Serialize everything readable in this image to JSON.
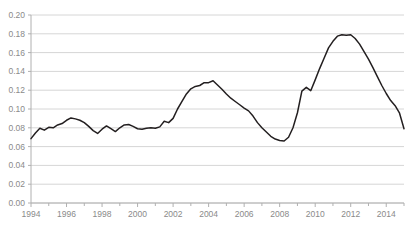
{
  "chart_data": {
    "type": "line",
    "title": "",
    "subtitle": "",
    "xlabel": "",
    "ylabel": "",
    "grid": true,
    "legend": false,
    "legend_position": "none",
    "line_color": "#231f20",
    "grid_color": "#d6d6d6",
    "axis_color": "#b0b0b0",
    "tick_label_color": "#8a8a8a",
    "xlim": [
      1994,
      2015.0
    ],
    "ylim": [
      0.0,
      0.2
    ],
    "y_ticks": [
      "0.00",
      "0.02",
      "0.04",
      "0.06",
      "0.08",
      "0.10",
      "0.12",
      "0.14",
      "0.16",
      "0.18",
      "0.20"
    ],
    "y_tick_values": [
      0.0,
      0.02,
      0.04,
      0.06,
      0.08,
      0.1,
      0.12,
      0.14,
      0.16,
      0.18,
      0.2
    ],
    "x_ticks": [
      "1994",
      "1996",
      "1998",
      "2000",
      "2002",
      "2004",
      "2006",
      "2008",
      "2010",
      "2012",
      "2014"
    ],
    "x_tick_values": [
      1994,
      1996,
      1998,
      2000,
      2002,
      2004,
      2006,
      2008,
      2010,
      2012,
      2014
    ],
    "x_minor_tick_values": [
      1995,
      1997,
      1999,
      2001,
      2003,
      2005,
      2007,
      2009,
      2011,
      2013,
      2015
    ],
    "series": [
      {
        "name": "series-1",
        "x": [
          1994.0,
          1994.25,
          1994.5,
          1994.75,
          1995.0,
          1995.25,
          1995.5,
          1995.75,
          1996.0,
          1996.25,
          1996.5,
          1996.75,
          1997.0,
          1997.25,
          1997.5,
          1997.75,
          1998.0,
          1998.25,
          1998.5,
          1998.75,
          1999.0,
          1999.25,
          1999.5,
          1999.75,
          2000.0,
          2000.25,
          2000.5,
          2000.75,
          2001.0,
          2001.25,
          2001.5,
          2001.75,
          2002.0,
          2002.25,
          2002.5,
          2002.75,
          2003.0,
          2003.25,
          2003.5,
          2003.75,
          2004.0,
          2004.25,
          2004.5,
          2004.75,
          2005.0,
          2005.25,
          2005.5,
          2005.75,
          2006.0,
          2006.25,
          2006.5,
          2006.75,
          2007.0,
          2007.25,
          2007.5,
          2007.75,
          2008.0,
          2008.25,
          2008.5,
          2008.75,
          2009.0,
          2009.25,
          2009.5,
          2009.75,
          2010.0,
          2010.25,
          2010.5,
          2010.75,
          2011.0,
          2011.25,
          2011.5,
          2011.75,
          2012.0,
          2012.25,
          2012.5,
          2012.75,
          2013.0,
          2013.25,
          2013.5,
          2013.75,
          2014.0,
          2014.25,
          2014.5,
          2014.75,
          2015.0
        ],
        "y": [
          0.0685,
          0.0745,
          0.0795,
          0.0775,
          0.0805,
          0.08,
          0.083,
          0.0845,
          0.088,
          0.0905,
          0.0895,
          0.088,
          0.0855,
          0.0815,
          0.077,
          0.074,
          0.0785,
          0.082,
          0.079,
          0.076,
          0.08,
          0.083,
          0.0835,
          0.0815,
          0.079,
          0.0785,
          0.0795,
          0.08,
          0.0795,
          0.081,
          0.087,
          0.0855,
          0.09,
          0.1,
          0.108,
          0.116,
          0.1215,
          0.124,
          0.125,
          0.128,
          0.128,
          0.13,
          0.1255,
          0.121,
          0.116,
          0.1115,
          0.108,
          0.1045,
          0.101,
          0.098,
          0.0925,
          0.0855,
          0.08,
          0.0755,
          0.071,
          0.068,
          0.0665,
          0.066,
          0.07,
          0.08,
          0.096,
          0.119,
          0.123,
          0.1195,
          0.131,
          0.143,
          0.154,
          0.165,
          0.172,
          0.1775,
          0.179,
          0.1785,
          0.179,
          0.175,
          0.169,
          0.161,
          0.153,
          0.144,
          0.1345,
          0.125,
          0.1165,
          0.109,
          0.1035,
          0.0955,
          0.079
        ]
      }
    ],
    "notable_points": {
      "start_1994": 0.0685,
      "peak_1996": 0.0905,
      "peak_2004": 0.13,
      "trough_2008": 0.066,
      "peak_2011": 0.179,
      "end_2015": 0.079
    }
  }
}
